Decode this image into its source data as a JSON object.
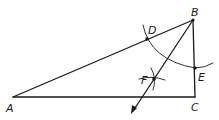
{
  "diagram": {
    "type": "geometry-construction",
    "points": {
      "A": {
        "label": "A",
        "x": 13,
        "y": 97
      },
      "B": {
        "label": "B",
        "x": 193,
        "y": 20
      },
      "C": {
        "label": "C",
        "x": 195,
        "y": 97
      },
      "D": {
        "label": "D",
        "x": 147,
        "y": 39
      },
      "E": {
        "label": "E",
        "x": 195,
        "y": 68
      },
      "F": {
        "label": "F",
        "x": 154,
        "y": 79
      }
    },
    "segments": [
      "AB",
      "BC",
      "CA"
    ],
    "ray": {
      "from": "B",
      "through": "F"
    },
    "colors": {
      "stroke": "#1a1a1a",
      "background": "#ffffff"
    }
  }
}
